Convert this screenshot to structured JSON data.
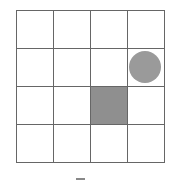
{
  "grid": {
    "rows": 4,
    "cols": 4,
    "cell_w": 37,
    "cell_h": 38,
    "line_color": "#666666",
    "filled_cells": [
      {
        "row": 2,
        "col": 2,
        "color": "#8f8f8f"
      }
    ],
    "agent": {
      "row": 1,
      "col": 3,
      "shape": "circle",
      "color": "#9a9a9a"
    }
  },
  "caption": "-"
}
